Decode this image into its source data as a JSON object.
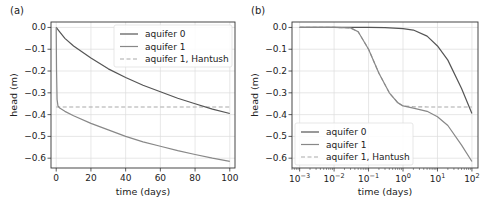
{
  "chart_data": [
    {
      "panel_label": "(a)",
      "type": "line",
      "xlabel": "time (days)",
      "ylabel": "head (m)",
      "xscale": "linear",
      "xlim": [
        -3,
        103
      ],
      "ylim": [
        -0.645,
        0.025
      ],
      "xticks": [
        0,
        20,
        40,
        60,
        80,
        100
      ],
      "xtick_labels": [
        "0",
        "20",
        "40",
        "60",
        "80",
        "100"
      ],
      "yticks": [
        0.0,
        -0.1,
        -0.2,
        -0.3,
        -0.4,
        -0.5,
        -0.6
      ],
      "ytick_labels": [
        "0.0",
        "−0.1",
        "−0.2",
        "−0.3",
        "−0.4",
        "−0.5",
        "−0.6"
      ],
      "grid": true,
      "legend_position": "upper right",
      "series": [
        {
          "name": "aquifer 0",
          "color": "#555555",
          "style": "solid",
          "x": [
            0,
            1,
            2,
            5,
            10,
            20,
            30,
            40,
            50,
            60,
            70,
            80,
            90,
            100
          ],
          "y": [
            0.0,
            -0.01,
            -0.02,
            -0.05,
            -0.085,
            -0.14,
            -0.19,
            -0.23,
            -0.265,
            -0.295,
            -0.325,
            -0.35,
            -0.375,
            -0.395
          ]
        },
        {
          "name": "aquifer 1",
          "color": "#888888",
          "style": "solid",
          "x": [
            0,
            0.2,
            0.5,
            1,
            2,
            5,
            10,
            20,
            30,
            40,
            50,
            60,
            70,
            80,
            90,
            100
          ],
          "y": [
            0.0,
            -0.2,
            -0.33,
            -0.36,
            -0.37,
            -0.385,
            -0.405,
            -0.44,
            -0.47,
            -0.5,
            -0.525,
            -0.545,
            -0.565,
            -0.583,
            -0.6,
            -0.615
          ]
        },
        {
          "name": "aquifer 1, Hantush",
          "color": "#aaaaaa",
          "style": "dashed",
          "x": [
            0,
            100
          ],
          "y": [
            -0.365,
            -0.365
          ]
        }
      ]
    },
    {
      "panel_label": "(b)",
      "type": "line",
      "xlabel": "time (days)",
      "ylabel": "head (m)",
      "xscale": "log",
      "xlim": [
        0.0006,
        150
      ],
      "ylim": [
        -0.645,
        0.025
      ],
      "xticks": [
        0.001,
        0.01,
        0.1,
        1,
        10,
        100
      ],
      "xtick_labels": [
        [
          "10",
          "−3"
        ],
        [
          "10",
          "−2"
        ],
        [
          "10",
          "−1"
        ],
        [
          "10",
          "0"
        ],
        [
          "10",
          "1"
        ],
        [
          "10",
          "2"
        ]
      ],
      "yticks": [
        0.0,
        -0.1,
        -0.2,
        -0.3,
        -0.4,
        -0.5,
        -0.6
      ],
      "ytick_labels": [
        "0.0",
        "−0.1",
        "−0.2",
        "−0.3",
        "−0.4",
        "−0.5",
        "−0.6"
      ],
      "grid": true,
      "legend_position": "lower left",
      "series": [
        {
          "name": "aquifer 0",
          "color": "#555555",
          "style": "solid",
          "x": [
            0.001,
            0.01,
            0.1,
            0.3,
            1,
            2,
            5,
            10,
            20,
            50,
            100
          ],
          "y": [
            0.0,
            0.0,
            0.0,
            -0.001,
            -0.005,
            -0.012,
            -0.04,
            -0.085,
            -0.15,
            -0.28,
            -0.395
          ]
        },
        {
          "name": "aquifer 1",
          "color": "#888888",
          "style": "solid",
          "x": [
            0.001,
            0.01,
            0.03,
            0.05,
            0.1,
            0.2,
            0.4,
            0.7,
            1,
            2,
            5,
            10,
            20,
            50,
            100
          ],
          "y": [
            0.0,
            0.0,
            -0.002,
            -0.02,
            -0.1,
            -0.21,
            -0.3,
            -0.345,
            -0.36,
            -0.37,
            -0.385,
            -0.41,
            -0.45,
            -0.54,
            -0.615
          ]
        },
        {
          "name": "aquifer 1, Hantush",
          "color": "#aaaaaa",
          "style": "dashed",
          "x": [
            0.001,
            0.01,
            0.03,
            0.05,
            0.1,
            0.2,
            0.4,
            0.7,
            1,
            2,
            5,
            10,
            100
          ],
          "y": [
            0.0,
            0.0,
            -0.002,
            -0.02,
            -0.1,
            -0.21,
            -0.3,
            -0.345,
            -0.36,
            -0.364,
            -0.365,
            -0.365,
            -0.365
          ]
        }
      ]
    }
  ]
}
